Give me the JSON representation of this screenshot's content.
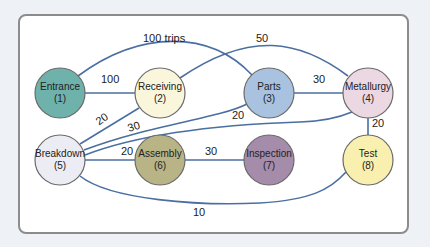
{
  "diagram": {
    "nodes": [
      {
        "id": 1,
        "name": "Entrance",
        "num": "(1)",
        "cx": 60,
        "cy": 93,
        "color": "#6fb2ab"
      },
      {
        "id": 2,
        "name": "Receiving",
        "num": "(2)",
        "cx": 160,
        "cy": 93,
        "color": "#faf6dc"
      },
      {
        "id": 3,
        "name": "Parts",
        "num": "(3)",
        "cx": 269,
        "cy": 93,
        "color": "#a9c2e0"
      },
      {
        "id": 4,
        "name": "Metallurgy",
        "num": "(4)",
        "cx": 368,
        "cy": 93,
        "color": "#ecd8e2"
      },
      {
        "id": 5,
        "name": "Breakdown",
        "num": "(5)",
        "cx": 60,
        "cy": 160,
        "color": "#ececf4"
      },
      {
        "id": 6,
        "name": "Assembly",
        "num": "(6)",
        "cx": 160,
        "cy": 160,
        "color": "#b9b486"
      },
      {
        "id": 7,
        "name": "Inspection",
        "num": "(7)",
        "cx": 269,
        "cy": 160,
        "color": "#a48caa"
      },
      {
        "id": 8,
        "name": "Test",
        "num": "(8)",
        "cx": 368,
        "cy": 160,
        "color": "#f9efaf"
      }
    ],
    "edges": [
      {
        "from": 1,
        "to": 3,
        "label": "100 trips"
      },
      {
        "from": 1,
        "to": 2,
        "label": "100"
      },
      {
        "from": 2,
        "to": 4,
        "label": "50"
      },
      {
        "from": 3,
        "to": 4,
        "label": "30"
      },
      {
        "from": 5,
        "to": 2,
        "label": "20"
      },
      {
        "from": 5,
        "to": 3,
        "label": "30"
      },
      {
        "from": 5,
        "to": 4,
        "label": "20"
      },
      {
        "from": 4,
        "to": 8,
        "label": "20"
      },
      {
        "from": 5,
        "to": 6,
        "label": "20"
      },
      {
        "from": 6,
        "to": 7,
        "label": "30"
      },
      {
        "from": 5,
        "to": 8,
        "label": "10"
      }
    ]
  }
}
